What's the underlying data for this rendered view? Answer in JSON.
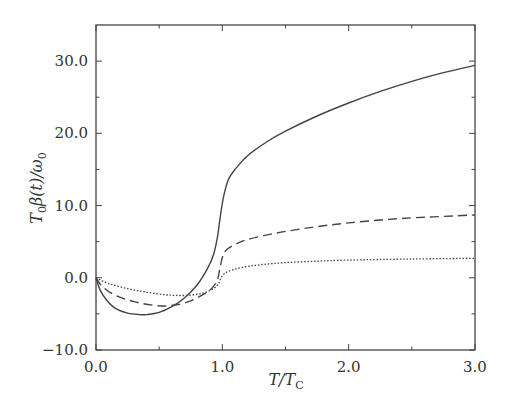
{
  "chart_data": {
    "type": "line",
    "title": "",
    "xlabel": "T/T_C",
    "ylabel": "T_0 β(t)/ω_0",
    "xlim": [
      0.0,
      3.0
    ],
    "ylim": [
      -10.0,
      35.0
    ],
    "grid": false,
    "legend": null,
    "x_ticks": [
      0.0,
      1.0,
      2.0,
      3.0
    ],
    "x_tick_labels": [
      "0.0",
      "1.0",
      "2.0",
      "3.0"
    ],
    "x_minor_ticks": [
      0.5,
      1.5,
      2.5
    ],
    "y_ticks": [
      -10.0,
      0.0,
      10.0,
      20.0,
      30.0
    ],
    "y_tick_labels": [
      "−10.0",
      "0.0",
      "10.0",
      "20.0",
      "30.0"
    ],
    "y_minor_ticks": [
      -5.0,
      5.0,
      15.0,
      25.0
    ],
    "series": [
      {
        "name": "solid",
        "style": "solid",
        "x": [
          0.0,
          0.03,
          0.08,
          0.15,
          0.25,
          0.35,
          0.4,
          0.5,
          0.6,
          0.7,
          0.8,
          0.88,
          0.93,
          0.96,
          0.98,
          1.0,
          1.02,
          1.05,
          1.1,
          1.2,
          1.35,
          1.5,
          1.75,
          2.0,
          2.25,
          2.5,
          2.75,
          3.0
        ],
        "y": [
          0.0,
          -1.6,
          -3.0,
          -4.2,
          -4.9,
          -5.1,
          -5.1,
          -4.8,
          -4.0,
          -2.8,
          -1.0,
          1.2,
          3.2,
          5.5,
          8.0,
          10.3,
          12.0,
          13.7,
          15.0,
          16.9,
          18.8,
          20.3,
          22.4,
          24.2,
          25.8,
          27.2,
          28.4,
          29.4
        ]
      },
      {
        "name": "dashed",
        "style": "dashed",
        "x": [
          0.0,
          0.05,
          0.15,
          0.3,
          0.45,
          0.55,
          0.65,
          0.75,
          0.85,
          0.92,
          0.96,
          0.98,
          1.0,
          1.03,
          1.1,
          1.2,
          1.4,
          1.6,
          1.8,
          2.0,
          2.25,
          2.5,
          2.75,
          3.0
        ],
        "y": [
          0.0,
          -1.2,
          -2.4,
          -3.3,
          -3.8,
          -3.9,
          -3.7,
          -3.2,
          -2.3,
          -1.4,
          -0.3,
          1.2,
          2.8,
          3.8,
          4.6,
          5.3,
          6.1,
          6.7,
          7.2,
          7.6,
          8.0,
          8.3,
          8.5,
          8.7
        ]
      },
      {
        "name": "dotted",
        "style": "dotted",
        "x": [
          0.0,
          0.1,
          0.25,
          0.4,
          0.55,
          0.65,
          0.75,
          0.85,
          0.93,
          0.97,
          1.0,
          1.05,
          1.15,
          1.3,
          1.5,
          1.75,
          2.0,
          2.5,
          3.0
        ],
        "y": [
          0.0,
          -0.8,
          -1.5,
          -2.0,
          -2.35,
          -2.45,
          -2.4,
          -2.1,
          -1.5,
          -0.8,
          0.3,
          0.9,
          1.4,
          1.8,
          2.1,
          2.3,
          2.45,
          2.6,
          2.7
        ]
      }
    ]
  }
}
